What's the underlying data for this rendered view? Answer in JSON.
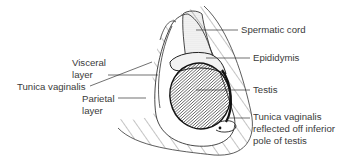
{
  "diagram": {
    "labels": {
      "spermatic_cord": "Spermatic cord",
      "epididymis": "Epididymis",
      "testis": "Testis",
      "tunica_reflected_line1": "Tunica vaginalis",
      "tunica_reflected_line2": "reflected off inferior",
      "tunica_reflected_line3": "pole of testis",
      "visceral_line1": "Visceral",
      "visceral_line2": "layer",
      "tunica_vaginalis": "Tunica vaginalis",
      "parietal_line1": "Parietal",
      "parietal_line2": "layer"
    },
    "colors": {
      "ink": "#2a2a2a",
      "text": "#3a3a3a",
      "background": "#ffffff"
    }
  }
}
